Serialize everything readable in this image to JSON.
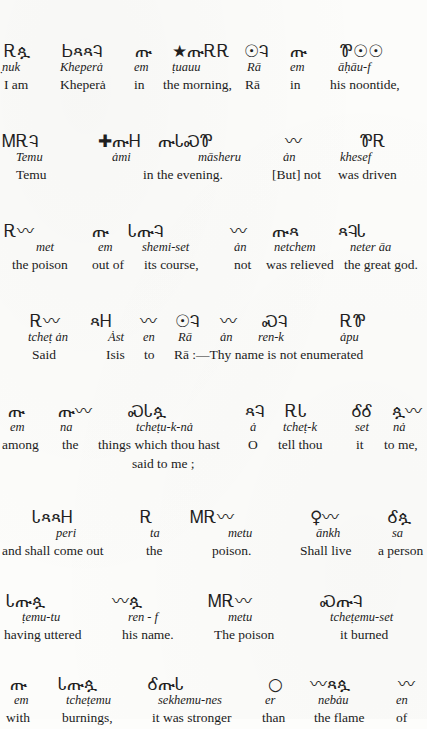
{
  "page": {
    "folio": "551",
    "running_title": "RĀ AND ISIS",
    "ink_color": "#1f1f1f",
    "paper_color": "#fcfcfa"
  },
  "blocks": [
    {
      "id": "block-1",
      "glyphs": [
        {
          "x": 4,
          "g": "Ꭱጷ"
        },
        {
          "x": 62,
          "g": "ᏏጻጻᎸ"
        },
        {
          "x": 135,
          "g": "ጡ"
        },
        {
          "x": 172,
          "g": "★ጡᎡᎡ"
        },
        {
          "x": 244,
          "g": "☉Ꮈ"
        },
        {
          "x": 290,
          "g": "ጡ"
        },
        {
          "x": 340,
          "g": "Ꮘ☉☉"
        }
      ],
      "translit": [
        {
          "x": 2,
          "t": "̣nuk"
        },
        {
          "x": 60,
          "t": "Kheperȧ"
        },
        {
          "x": 134,
          "t": "em"
        },
        {
          "x": 172,
          "t": "ṭuauu"
        },
        {
          "x": 247,
          "t": "Rā"
        },
        {
          "x": 290,
          "t": "em"
        },
        {
          "x": 338,
          "t": "āḥāu-f"
        }
      ],
      "translation": [
        {
          "x": 4,
          "t": "I am"
        },
        {
          "x": 60,
          "t": "Kheperȧ"
        },
        {
          "x": 134,
          "t": "in"
        },
        {
          "x": 163,
          "t": "the morning,"
        },
        {
          "x": 245,
          "t": "Rā"
        },
        {
          "x": 290,
          "t": "in"
        },
        {
          "x": 330,
          "t": "his noontide,"
        }
      ],
      "bleed_note": "am"
    },
    {
      "id": "block-2",
      "glyphs": [
        {
          "x": 2,
          "g": "ᎷᎡᎸ"
        },
        {
          "x": 98,
          "g": "✚ጡᎻ"
        },
        {
          "x": 158,
          "g": "ጡᏓᏍᏈ"
        },
        {
          "x": 285,
          "g": "〰"
        },
        {
          "x": 360,
          "g": "ᏈᎡ"
        }
      ],
      "translit": [
        {
          "x": 16,
          "t": "Temu"
        },
        {
          "x": 112,
          "t": "ȧmi"
        },
        {
          "x": 198,
          "t": "māsheru"
        },
        {
          "x": 283,
          "t": "ȧn"
        },
        {
          "x": 340,
          "t": "khesef"
        }
      ],
      "translation": [
        {
          "x": 16,
          "t": "Temu"
        },
        {
          "x": 143,
          "t": "in the evening."
        },
        {
          "x": 272,
          "t": "[But] not"
        },
        {
          "x": 338,
          "t": "was driven"
        }
      ]
    },
    {
      "id": "block-3",
      "glyphs": [
        {
          "x": 4,
          "g": "Ꭱ〰"
        },
        {
          "x": 92,
          "g": "ጡ"
        },
        {
          "x": 128,
          "g": "ᏓጡᎸ"
        },
        {
          "x": 230,
          "g": "〰"
        },
        {
          "x": 272,
          "g": "ጡጻ"
        },
        {
          "x": 338,
          "g": "ጻᎸᏓ"
        }
      ],
      "translit": [
        {
          "x": 36,
          "t": "met"
        },
        {
          "x": 98,
          "t": "em"
        },
        {
          "x": 142,
          "t": "shemi-set"
        },
        {
          "x": 234,
          "t": "ȧn"
        },
        {
          "x": 274,
          "t": "netchem"
        },
        {
          "x": 350,
          "t": "neter āa"
        }
      ],
      "translation": [
        {
          "x": 12,
          "t": "the poison"
        },
        {
          "x": 92,
          "t": "out of"
        },
        {
          "x": 144,
          "t": "its course,"
        },
        {
          "x": 234,
          "t": "not"
        },
        {
          "x": 266,
          "t": "was relieved"
        },
        {
          "x": 344,
          "t": "the great god."
        }
      ]
    },
    {
      "id": "block-4",
      "glyphs": [
        {
          "x": 30,
          "g": "Ꭱ〰"
        },
        {
          "x": 90,
          "g": "ጻᎻ"
        },
        {
          "x": 140,
          "g": "〰"
        },
        {
          "x": 175,
          "g": "☉Ꮈ"
        },
        {
          "x": 220,
          "g": "〰"
        },
        {
          "x": 262,
          "g": "ᏍᎸ"
        },
        {
          "x": 340,
          "g": "ᎡᏈ"
        }
      ],
      "translit": [
        {
          "x": 28,
          "t": "tcheṭ ȧn"
        },
        {
          "x": 108,
          "t": "Ȧst"
        },
        {
          "x": 143,
          "t": "en"
        },
        {
          "x": 178,
          "t": "Rā"
        },
        {
          "x": 220,
          "t": "ȧn"
        },
        {
          "x": 258,
          "t": "ren-k"
        },
        {
          "x": 340,
          "t": "ȧpu"
        }
      ],
      "translation": [
        {
          "x": 32,
          "t": "Said"
        },
        {
          "x": 106,
          "t": "Isis"
        },
        {
          "x": 144,
          "t": "to"
        },
        {
          "x": 174,
          "t": "Rā :—Thy name is not enumerated"
        }
      ]
    },
    {
      "id": "block-5",
      "glyphs": [
        {
          "x": 8,
          "g": "ጡ"
        },
        {
          "x": 58,
          "g": "ጡ〰"
        },
        {
          "x": 128,
          "g": "ᏍᏓጷ"
        },
        {
          "x": 245,
          "g": "ጻᎸ"
        },
        {
          "x": 285,
          "g": "ᎡᏓ"
        },
        {
          "x": 352,
          "g": "ᎴᎴ"
        },
        {
          "x": 392,
          "g": "ጷ〰"
        }
      ],
      "translit": [
        {
          "x": 10,
          "t": "em"
        },
        {
          "x": 60,
          "t": "na"
        },
        {
          "x": 136,
          "t": "tcheṭu-k-nȧ"
        },
        {
          "x": 250,
          "t": "ȧ"
        },
        {
          "x": 283,
          "t": "tcheṭ-k"
        },
        {
          "x": 355,
          "t": "set"
        },
        {
          "x": 393,
          "t": "nȧ"
        }
      ],
      "translation": [
        {
          "x": 2,
          "t": "among"
        },
        {
          "x": 62,
          "t": "the"
        },
        {
          "x": 98,
          "t": "things which thou hast"
        },
        {
          "x": 248,
          "t": "O"
        },
        {
          "x": 278,
          "t": "tell thou"
        },
        {
          "x": 356,
          "t": "it"
        },
        {
          "x": 384,
          "t": "to me,"
        }
      ],
      "translation_line2": [
        {
          "x": 132,
          "t": "said to me ;"
        }
      ]
    },
    {
      "id": "block-6",
      "glyphs": [
        {
          "x": 32,
          "g": "ᏓጻጻᎻ"
        },
        {
          "x": 140,
          "g": "Ꭱ"
        },
        {
          "x": 190,
          "g": "ᎷᎡ〰"
        },
        {
          "x": 310,
          "g": "♀〰"
        },
        {
          "x": 388,
          "g": "Ꮄጷ"
        }
      ],
      "translit": [
        {
          "x": 56,
          "t": "peri"
        },
        {
          "x": 150,
          "t": "ta"
        },
        {
          "x": 228,
          "t": "metu"
        },
        {
          "x": 316,
          "t": "ānkh"
        },
        {
          "x": 392,
          "t": "sa"
        }
      ],
      "translation": [
        {
          "x": 2,
          "t": "and shall come out"
        },
        {
          "x": 146,
          "t": "the"
        },
        {
          "x": 212,
          "t": "poison."
        },
        {
          "x": 300,
          "t": "Shall live"
        },
        {
          "x": 378,
          "t": "a person"
        }
      ]
    },
    {
      "id": "block-7",
      "glyphs": [
        {
          "x": 6,
          "g": "Ꮣጡጷ"
        },
        {
          "x": 112,
          "g": "〰ጷ"
        },
        {
          "x": 208,
          "g": "ᎷᎡ〰"
        },
        {
          "x": 320,
          "g": "ᏍጡᎸ"
        }
      ],
      "translit": [
        {
          "x": 22,
          "t": "ṭemu-tu"
        },
        {
          "x": 128,
          "t": "ren - f"
        },
        {
          "x": 228,
          "t": "metu"
        },
        {
          "x": 330,
          "t": "tcheṭemu-set"
        }
      ],
      "translation": [
        {
          "x": 4,
          "t": "having uttered"
        },
        {
          "x": 122,
          "t": "his name."
        },
        {
          "x": 214,
          "t": "The poison"
        },
        {
          "x": 340,
          "t": "it burned"
        }
      ]
    },
    {
      "id": "block-8",
      "glyphs": [
        {
          "x": 10,
          "g": "ጡ"
        },
        {
          "x": 58,
          "g": "Ꮣጡጷ"
        },
        {
          "x": 148,
          "g": "ᎴጡᏓ"
        },
        {
          "x": 268,
          "g": "○"
        },
        {
          "x": 310,
          "g": "〰ጻጷ"
        },
        {
          "x": 398,
          "g": "〰"
        }
      ],
      "translit": [
        {
          "x": 14,
          "t": "em"
        },
        {
          "x": 66,
          "t": "tcheṭemu"
        },
        {
          "x": 158,
          "t": "sekhemu-nes"
        },
        {
          "x": 265,
          "t": "er"
        },
        {
          "x": 318,
          "t": "nebȧu"
        },
        {
          "x": 396,
          "t": "en"
        }
      ],
      "translation": [
        {
          "x": 6,
          "t": "with"
        },
        {
          "x": 62,
          "t": "burnings,"
        },
        {
          "x": 152,
          "t": "it was stronger"
        },
        {
          "x": 262,
          "t": "than"
        },
        {
          "x": 314,
          "t": "the flame"
        },
        {
          "x": 396,
          "t": "of"
        }
      ]
    }
  ]
}
